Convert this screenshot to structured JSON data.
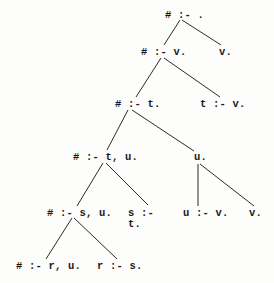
{
  "diagram": {
    "type": "derivation-tree",
    "nodes": [
      {
        "id": "n0",
        "label": "# :- .",
        "x": 165,
        "y": 10
      },
      {
        "id": "n1",
        "label": "# :- v.",
        "x": 141,
        "y": 47
      },
      {
        "id": "n2",
        "label": "v.",
        "x": 219,
        "y": 47
      },
      {
        "id": "n3",
        "label": "# :- t.",
        "x": 115,
        "y": 99
      },
      {
        "id": "n4",
        "label": "t :- v.",
        "x": 200,
        "y": 99
      },
      {
        "id": "n5",
        "label": "# :- t, u.",
        "x": 73,
        "y": 152
      },
      {
        "id": "n6",
        "label": "u.",
        "x": 194,
        "y": 152
      },
      {
        "id": "n7",
        "label": "# :- s, u.",
        "x": 47,
        "y": 208
      },
      {
        "id": "n8",
        "label": "s :-\nt.",
        "x": 128,
        "y": 208
      },
      {
        "id": "n9",
        "label": "u :- v.",
        "x": 183,
        "y": 208
      },
      {
        "id": "n10",
        "label": "v.",
        "x": 249,
        "y": 208
      },
      {
        "id": "n11",
        "label": "# :- r, u.",
        "x": 16,
        "y": 261
      },
      {
        "id": "n12",
        "label": "r :- s.",
        "x": 97,
        "y": 261
      }
    ],
    "edges": [
      {
        "from": "n0",
        "to": "n1",
        "x1": 180,
        "y1": 20,
        "x2": 164,
        "y2": 45
      },
      {
        "from": "n0",
        "to": "n2",
        "x1": 182,
        "y1": 20,
        "x2": 221,
        "y2": 45
      },
      {
        "from": "n1",
        "to": "n3",
        "x1": 161,
        "y1": 58,
        "x2": 136,
        "y2": 97
      },
      {
        "from": "n1",
        "to": "n4",
        "x1": 164,
        "y1": 58,
        "x2": 220,
        "y2": 97
      },
      {
        "from": "n3",
        "to": "n5",
        "x1": 128,
        "y1": 110,
        "x2": 107,
        "y2": 150
      },
      {
        "from": "n3",
        "to": "n6",
        "x1": 132,
        "y1": 110,
        "x2": 194,
        "y2": 151
      },
      {
        "from": "n5",
        "to": "n7",
        "x1": 103,
        "y1": 163,
        "x2": 77,
        "y2": 206
      },
      {
        "from": "n5",
        "to": "n8",
        "x1": 106,
        "y1": 163,
        "x2": 148,
        "y2": 205
      },
      {
        "from": "n6",
        "to": "n9",
        "x1": 198,
        "y1": 164,
        "x2": 198,
        "y2": 206
      },
      {
        "from": "n6",
        "to": "n10",
        "x1": 200,
        "y1": 164,
        "x2": 254,
        "y2": 206
      },
      {
        "from": "n7",
        "to": "n11",
        "x1": 72,
        "y1": 218,
        "x2": 46,
        "y2": 259
      },
      {
        "from": "n7",
        "to": "n12",
        "x1": 74,
        "y1": 218,
        "x2": 117,
        "y2": 259
      }
    ]
  }
}
